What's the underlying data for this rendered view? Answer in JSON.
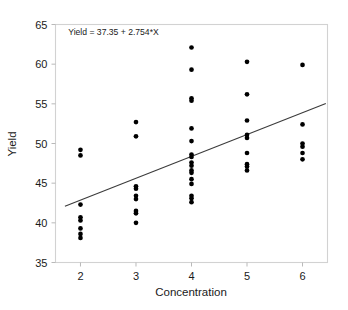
{
  "chart_data": {
    "type": "scatter",
    "title": "",
    "xlabel": "Concentration",
    "ylabel": "Yield",
    "xlim": [
      1.55,
      6.45
    ],
    "ylim": [
      35,
      65
    ],
    "xticks": [
      2,
      3,
      4,
      5,
      6
    ],
    "yticks": [
      35,
      40,
      45,
      50,
      55,
      60,
      65
    ],
    "xtick_labels": [
      "2",
      "3",
      "4",
      "5",
      "6"
    ],
    "ytick_labels": [
      "35",
      "40",
      "45",
      "50",
      "55",
      "60",
      "65"
    ],
    "grid": false,
    "legend": null,
    "annotations": [
      {
        "text": "Yield = 37.35 + 2.754*X",
        "x": 1.78,
        "y": 63.7
      }
    ],
    "fit_line": {
      "label": "Yield = 37.35 + 2.754*X",
      "intercept": 37.35,
      "slope": 2.754,
      "x_start": 1.72,
      "x_end": 6.42,
      "y_start": 42.09,
      "y_end": 55.03
    },
    "marker": {
      "shape": "circle",
      "color": "#000000",
      "size": 4.6
    },
    "points": [
      {
        "x": 2,
        "y": 49.2
      },
      {
        "x": 2,
        "y": 48.5
      },
      {
        "x": 2,
        "y": 42.3
      },
      {
        "x": 2,
        "y": 40.7
      },
      {
        "x": 2,
        "y": 40.3
      },
      {
        "x": 2,
        "y": 39.3
      },
      {
        "x": 2,
        "y": 38.6
      },
      {
        "x": 2,
        "y": 38.1
      },
      {
        "x": 3,
        "y": 52.7
      },
      {
        "x": 3,
        "y": 50.9
      },
      {
        "x": 3,
        "y": 44.6
      },
      {
        "x": 3,
        "y": 44.3
      },
      {
        "x": 3,
        "y": 43.4
      },
      {
        "x": 3,
        "y": 43.0
      },
      {
        "x": 3,
        "y": 41.5
      },
      {
        "x": 3,
        "y": 41.2
      },
      {
        "x": 3,
        "y": 40.0
      },
      {
        "x": 4,
        "y": 62.1
      },
      {
        "x": 4,
        "y": 59.3
      },
      {
        "x": 4,
        "y": 55.7
      },
      {
        "x": 4,
        "y": 55.4
      },
      {
        "x": 4,
        "y": 51.9
      },
      {
        "x": 4,
        "y": 50.3
      },
      {
        "x": 4,
        "y": 48.6
      },
      {
        "x": 4,
        "y": 48.3
      },
      {
        "x": 4,
        "y": 47.6
      },
      {
        "x": 4,
        "y": 47.2
      },
      {
        "x": 4,
        "y": 46.6
      },
      {
        "x": 4,
        "y": 46.3
      },
      {
        "x": 4,
        "y": 45.5
      },
      {
        "x": 4,
        "y": 44.9
      },
      {
        "x": 4,
        "y": 43.4
      },
      {
        "x": 4,
        "y": 43.1
      },
      {
        "x": 4,
        "y": 42.6
      },
      {
        "x": 5,
        "y": 60.3
      },
      {
        "x": 5,
        "y": 56.2
      },
      {
        "x": 5,
        "y": 52.9
      },
      {
        "x": 5,
        "y": 51.1
      },
      {
        "x": 5,
        "y": 50.7
      },
      {
        "x": 5,
        "y": 48.8
      },
      {
        "x": 5,
        "y": 47.4
      },
      {
        "x": 5,
        "y": 47.1
      },
      {
        "x": 5,
        "y": 46.6
      },
      {
        "x": 6,
        "y": 59.9
      },
      {
        "x": 6,
        "y": 52.4
      },
      {
        "x": 6,
        "y": 50.0
      },
      {
        "x": 6,
        "y": 49.6
      },
      {
        "x": 6,
        "y": 48.8
      },
      {
        "x": 6,
        "y": 48.0
      }
    ]
  },
  "axes": {
    "x_title": "Concentration",
    "y_title": "Yield"
  },
  "colors": {
    "marker": "#000000",
    "fit_line": "#3b3b3b",
    "frame": "#d2d2d2",
    "background": "#ffffff",
    "text": "#1a1a1a"
  }
}
